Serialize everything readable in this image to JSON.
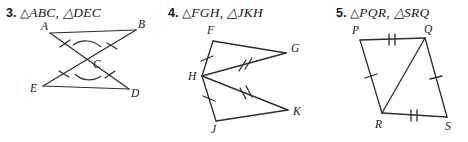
{
  "page": {
    "width": 468,
    "height": 142,
    "background": "#ffffff",
    "ink_color": "#2b2d33",
    "text_color": "#16171b"
  },
  "problems": [
    {
      "id": "problem-3",
      "number": "3.",
      "triangle_symbol": "△",
      "triangle_names": "ABC, △DEC",
      "prompt_full": "3. △ABC, △DEC",
      "figure": {
        "type": "bowtie-vertical-angles",
        "vertex_labels": [
          "A",
          "B",
          "C",
          "D",
          "E"
        ],
        "vertices": {
          "A": [
            50,
            33
          ],
          "B": [
            136,
            30
          ],
          "C": [
            89,
            60
          ],
          "D": [
            129,
            89
          ],
          "E": [
            43,
            86
          ]
        },
        "segments": [
          "A-B",
          "E-D",
          "A-D",
          "E-B"
        ],
        "tick_marks": [
          {
            "segment": "A-C",
            "count": 1
          },
          {
            "segment": "C-B",
            "count": 1
          },
          {
            "segment": "E-C",
            "count": 1
          },
          {
            "segment": "C-D",
            "count": 1
          }
        ],
        "angle_arcs": [
          {
            "vertex": "C",
            "angle": "ACB",
            "count": 1
          },
          {
            "vertex": "C",
            "angle": "ECD",
            "count": 1
          }
        ]
      }
    },
    {
      "id": "problem-4",
      "number": "4.",
      "triangle_symbol": "△",
      "triangle_names": "FGH, △JKH",
      "prompt_full": "4. △FGH, △JKH",
      "figure": {
        "type": "double-triangle-shared-vertex",
        "vertex_labels": [
          "F",
          "G",
          "H",
          "J",
          "K"
        ],
        "vertices": {
          "F": [
            213,
            41
          ],
          "G": [
            286,
            53
          ],
          "H": [
            202,
            76
          ],
          "J": [
            216,
            121
          ],
          "K": [
            288,
            110
          ]
        },
        "segments": [
          "F-G",
          "G-H",
          "H-F",
          "H-K",
          "K-J",
          "J-H"
        ],
        "tick_marks": [
          {
            "segment": "H-F",
            "count": 1
          },
          {
            "segment": "H-J",
            "count": 1
          },
          {
            "segment": "H-G",
            "count": 2
          },
          {
            "segment": "H-K",
            "count": 2
          }
        ],
        "angle_arcs": []
      }
    },
    {
      "id": "problem-5",
      "number": "5.",
      "triangle_symbol": "△",
      "triangle_names": "PQR, △SRQ",
      "prompt_full": "5. △PQR, △SRQ",
      "figure": {
        "type": "quadrilateral-with-diagonal",
        "vertex_labels": [
          "P",
          "Q",
          "R",
          "S"
        ],
        "vertices": {
          "P": [
            360,
            40
          ],
          "Q": [
            425,
            38
          ],
          "R": [
            382,
            113
          ],
          "S": [
            447,
            117
          ]
        },
        "segments": [
          "P-Q",
          "Q-S",
          "S-R",
          "R-P",
          "Q-R"
        ],
        "tick_marks": [
          {
            "segment": "P-Q",
            "count": 2
          },
          {
            "segment": "R-S",
            "count": 2
          },
          {
            "segment": "P-R",
            "count": 1
          },
          {
            "segment": "Q-S",
            "count": 1
          }
        ],
        "angle_arcs": []
      }
    }
  ]
}
